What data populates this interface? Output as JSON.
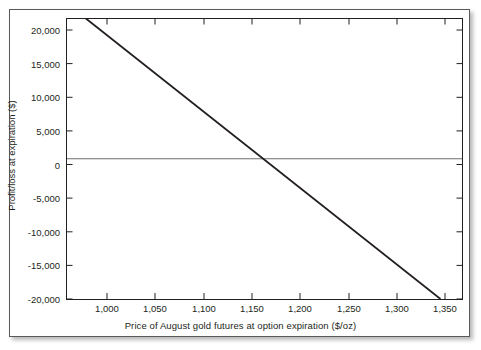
{
  "chart_data": {
    "type": "line",
    "title": "",
    "xlabel": "Price of August gold futures at option expiration ($/oz)",
    "ylabel": "Profit/loss at expiration ($)",
    "xlim": [
      975,
      1425
    ],
    "ylim": [
      -20000,
      20000
    ],
    "grid": false,
    "legend": "none",
    "xticks": [
      1000,
      1050,
      1100,
      1150,
      1200,
      1250,
      1300,
      1350,
      1400
    ],
    "xticklabels": [
      "1,000",
      "1,050",
      "1,100",
      "1,150",
      "1,200",
      "1,250",
      "1,300",
      "1,350",
      "1,400"
    ],
    "yticks": [
      20000,
      15000,
      10000,
      5000,
      0,
      -5000,
      -10000,
      -15000,
      -20000
    ],
    "yticklabels": [
      "20,000",
      "15,000",
      "10,000",
      "5,000",
      "0",
      "-5,000",
      "-10,000",
      "-15,000",
      "-20,000"
    ],
    "zero_line": 0,
    "series": [
      {
        "name": "Profit/loss at expiration",
        "color": "#231f20",
        "x": [
          997,
          1400
        ],
        "values": [
          20000,
          -20000
        ],
        "points": [
          {
            "x": 997,
            "y": 20000
          },
          {
            "x": 1050,
            "y": 14742
          },
          {
            "x": 1100,
            "y": 9777
          },
          {
            "x": 1150,
            "y": 4814
          },
          {
            "x": 1200,
            "y": -149
          },
          {
            "x": 1250,
            "y": -5112
          },
          {
            "x": 1300,
            "y": -10075
          },
          {
            "x": 1350,
            "y": -15038
          },
          {
            "x": 1400,
            "y": -20000
          }
        ]
      }
    ],
    "breakeven_x": 1199,
    "axis_color": "#231f20",
    "zero_line_color": "#6d6e71",
    "panel_border_color": "#58595b",
    "background_color": "#ffffff"
  }
}
